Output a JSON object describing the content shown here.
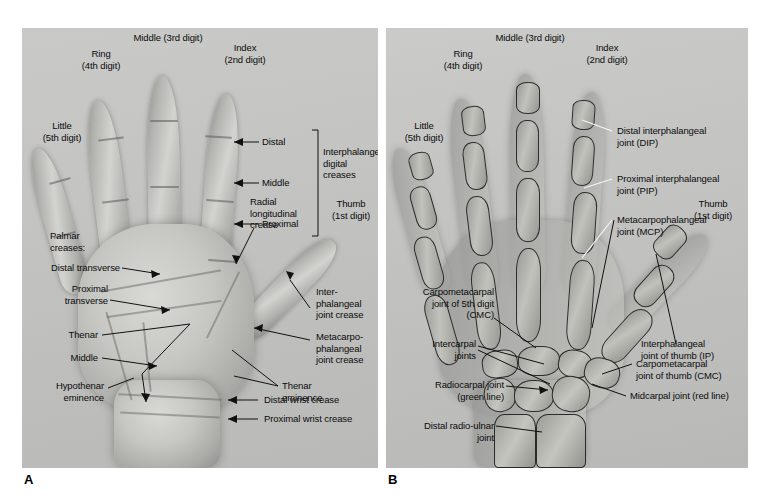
{
  "figure": {
    "panels": [
      {
        "letter": "A",
        "caption_letter": "A",
        "view": "palmar-surface-photograph"
      },
      {
        "letter": "B",
        "caption_letter": "B",
        "view": "hand-radiograph"
      }
    ]
  },
  "panel_a": {
    "digits": [
      {
        "name": "middle",
        "label": "Middle (3rd digit)"
      },
      {
        "name": "index",
        "label": "Index\n(2nd digit)"
      },
      {
        "name": "ring",
        "label": "Ring\n(4th digit)"
      },
      {
        "name": "little",
        "label": "Little\n(5th digit)"
      },
      {
        "name": "thumb",
        "label": "Thumb\n(1st digit)"
      }
    ],
    "crease_group": {
      "bracket_title": "Interphalangeal\ndigital\ncreases",
      "items": [
        {
          "key": "distal",
          "label": "Distal"
        },
        {
          "key": "middle",
          "label": "Middle"
        },
        {
          "key": "proximal",
          "label": "Proximal"
        }
      ]
    },
    "palmar_creases": {
      "heading": "Palmar\ncreases:",
      "items": [
        {
          "key": "distal-transverse",
          "label": "Distal transverse"
        },
        {
          "key": "proximal-transverse",
          "label": "Proximal\ntransverse"
        },
        {
          "key": "thenar",
          "label": "Thenar"
        },
        {
          "key": "middle",
          "label": "Middle"
        }
      ]
    },
    "labels": [
      {
        "key": "radial-longitudinal-crease",
        "label": "Radial\nlongitudinal\ncrease"
      },
      {
        "key": "interphalangeal-joint-crease",
        "label": "Inter-\nphalangeal\njoint crease"
      },
      {
        "key": "metacarpophalangeal-joint-crease",
        "label": "Metacarpo-\nphalangeal\njoint crease"
      },
      {
        "key": "thenar-eminence",
        "label": "Thenar\neminence"
      },
      {
        "key": "hypothenar-eminence",
        "label": "Hypothenar\neminence"
      },
      {
        "key": "distal-wrist-crease",
        "label": "Distal wrist crease"
      },
      {
        "key": "proximal-wrist-crease",
        "label": "Proximal wrist crease"
      }
    ]
  },
  "panel_b": {
    "digits": [
      {
        "name": "middle",
        "label": "Middle (3rd digit)"
      },
      {
        "name": "index",
        "label": "Index\n(2nd digit)"
      },
      {
        "name": "ring",
        "label": "Ring\n(4th digit)"
      },
      {
        "name": "little",
        "label": "Little\n(5th digit)"
      },
      {
        "name": "thumb",
        "label": "Thumb\n(1st digit)"
      }
    ],
    "labels": [
      {
        "key": "dip",
        "label": "Distal interphalangeal\njoint (DIP)"
      },
      {
        "key": "pip",
        "label": "Proximal interphalangeal\njoint (PIP)"
      },
      {
        "key": "mcp",
        "label": "Metacarpophalangeal\njoint (MCP)"
      },
      {
        "key": "ip-thumb",
        "label": "Interphalangeal\njoint of thumb (IP)"
      },
      {
        "key": "cmc-thumb",
        "label": "Carpometacarpal\njoint of thumb (CMC)"
      },
      {
        "key": "midcarpal",
        "label": "Midcarpal joint (red line)"
      },
      {
        "key": "cmc-5th",
        "label": "Carpometacarpal\njoint of 5th digit\n(CMC)"
      },
      {
        "key": "intercarpal",
        "label": "Intercarpal\njoints"
      },
      {
        "key": "radiocarpal",
        "label": "Radiocarpal joint\n(green line)"
      },
      {
        "key": "distal-radio-ulnar",
        "label": "Distal radio-ulnar\njoint"
      }
    ]
  },
  "colors": {
    "text": "#0b0b0b",
    "leader": "#111111",
    "leader_light": "#f2f2f2",
    "panel_bg": "#c4c4c2",
    "page_bg": "#ffffff"
  }
}
